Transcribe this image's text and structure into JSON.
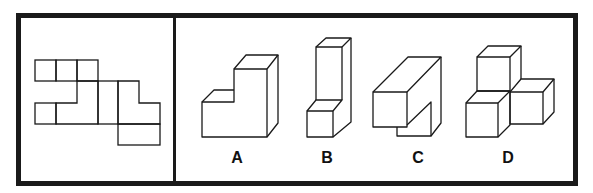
{
  "puzzle": {
    "type": "cube-net-folding",
    "stroke_color": "#1a1a1a",
    "frame_color": "#1a1a1a",
    "background": "#ffffff",
    "net": {
      "description": "unfolded net of a 3D shape",
      "unit": 21
    },
    "options": [
      {
        "id": "A",
        "label": "A",
        "x": 237,
        "y": 150
      },
      {
        "id": "B",
        "label": "B",
        "x": 327,
        "y": 150
      },
      {
        "id": "C",
        "label": "C",
        "x": 418,
        "y": 150
      },
      {
        "id": "D",
        "label": "D",
        "x": 508,
        "y": 150
      }
    ]
  }
}
